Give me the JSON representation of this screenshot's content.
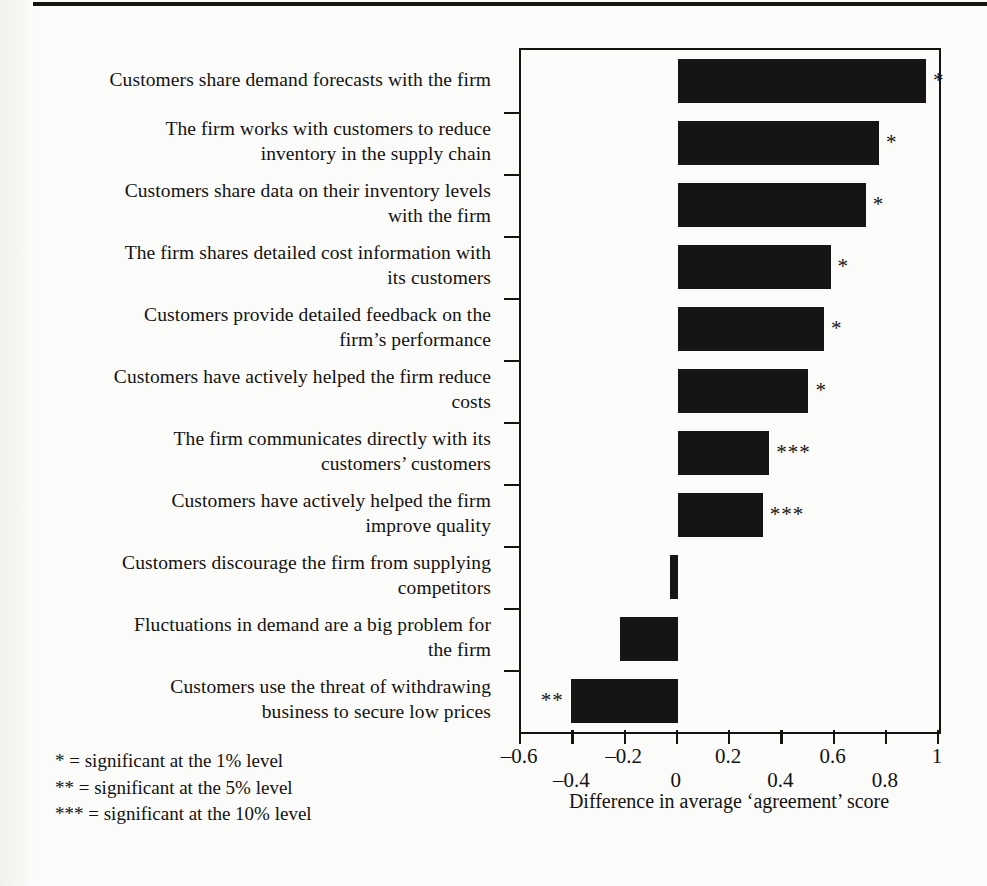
{
  "chart_data": {
    "type": "bar",
    "orientation": "horizontal",
    "title": "",
    "xlabel": "Difference in average 'agreement' score",
    "ylabel": "",
    "xlim": [
      -0.6,
      1
    ],
    "xticks": [
      -0.6,
      -0.4,
      -0.2,
      0,
      0.2,
      0.4,
      0.6,
      0.8,
      1
    ],
    "xtick_labels": [
      "–0.6",
      "–0.4",
      "–0.2",
      "0",
      "0.2",
      "0.4",
      "0.6",
      "0.8",
      "1"
    ],
    "grid": false,
    "legend": null,
    "bar_color": "#161513",
    "categories": [
      "Customers share demand forecasts with the firm",
      "The firm works with customers to reduce inventory in the supply chain",
      "Customers share data on their inventory levels with the firm",
      "The firm shares detailed cost information with its customers",
      "Customers provide detailed feedback on the firm’s performance",
      "Customers have actively helped the firm reduce costs",
      "The firm communicates directly with its customers’ customers",
      "Customers have actively helped the firm improve quality",
      "Customers discourage the firm from supplying competitors",
      "Fluctuations in demand are a big problem for the firm",
      "Customers use the threat of withdrawing business to secure low prices"
    ],
    "values": [
      0.95,
      0.77,
      0.72,
      0.585,
      0.56,
      0.5,
      0.35,
      0.325,
      -0.03,
      -0.22,
      -0.41
    ],
    "significance": [
      "*",
      "*",
      "*",
      "*",
      "*",
      "*",
      "***",
      "***",
      "",
      "",
      "**"
    ]
  },
  "labels": [
    {
      "lines": [
        "Customers share demand forecasts with the firm"
      ]
    },
    {
      "lines": [
        "The firm works with customers to reduce",
        "inventory in the supply chain"
      ]
    },
    {
      "lines": [
        "Customers share data on their inventory levels",
        "with the firm"
      ]
    },
    {
      "lines": [
        "The firm shares detailed cost information with",
        "its customers"
      ]
    },
    {
      "lines": [
        "Customers provide detailed feedback on the",
        "firm’s performance"
      ]
    },
    {
      "lines": [
        "Customers have actively helped the firm reduce",
        "costs"
      ]
    },
    {
      "lines": [
        "The firm communicates directly with its",
        "customers’ customers"
      ]
    },
    {
      "lines": [
        "Customers have actively helped the firm",
        "improve quality"
      ]
    },
    {
      "lines": [
        "Customers discourage the firm from supplying",
        "competitors"
      ]
    },
    {
      "lines": [
        "Fluctuations in demand are a big problem for",
        "the firm"
      ]
    },
    {
      "lines": [
        "Customers use the threat of withdrawing",
        "business to secure low prices"
      ]
    }
  ],
  "axis": {
    "title": "Difference in average ‘agreement’ score",
    "ticks": [
      {
        "value": -0.6,
        "text": "–0.6",
        "row": 1
      },
      {
        "value": -0.4,
        "text": "–0.4",
        "row": 2
      },
      {
        "value": -0.2,
        "text": "–0.2",
        "row": 1
      },
      {
        "value": 0,
        "text": "0",
        "row": 2
      },
      {
        "value": 0.2,
        "text": "0.2",
        "row": 1
      },
      {
        "value": 0.4,
        "text": "0.4",
        "row": 2
      },
      {
        "value": 0.6,
        "text": "0.6",
        "row": 1
      },
      {
        "value": 0.8,
        "text": "0.8",
        "row": 2
      },
      {
        "value": 1,
        "text": "1",
        "row": 1
      }
    ]
  },
  "footnotes": [
    "* = significant at the 1% level",
    "** = significant at the 5% level",
    "*** = significant at the 10% level"
  ]
}
